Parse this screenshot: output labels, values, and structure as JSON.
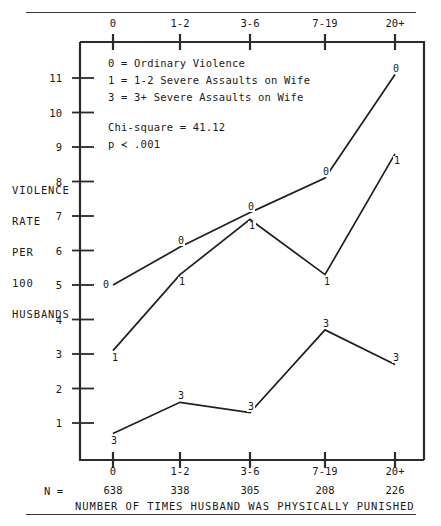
{
  "figure": {
    "y_axis_title_lines": [
      "VIOLENCE",
      "RATE",
      "PER",
      "100",
      "HUSBANDS"
    ],
    "x_axis_title": "NUMBER OF TIMES HUSBAND WAS PHYSICALLY PUNISHED",
    "n_prefix": "N =",
    "legend_lines": [
      "0 = Ordinary Violence",
      "1 = 1-2 Severe Assaults on Wife",
      "3 = 3+ Severe Assaults on Wife"
    ],
    "stats_lines": [
      "Chi-square = 41.12",
      "p ≺ .001"
    ]
  },
  "chart_data": {
    "type": "line",
    "title": "",
    "xlabel": "NUMBER OF TIMES HUSBAND WAS PHYSICALLY PUNISHED",
    "ylabel": "VIOLENCE RATE PER 100 HUSBANDS",
    "categories": [
      "0",
      "1-2",
      "3-6",
      "7-19",
      "20+"
    ],
    "group_sizes": [
      638,
      338,
      305,
      208,
      226
    ],
    "yticks": [
      1,
      2,
      3,
      4,
      5,
      6,
      7,
      8,
      9,
      10,
      11
    ],
    "ylim": [
      0,
      11.6
    ],
    "grid": false,
    "legend_position": "inside-top-left",
    "annotations": [
      "Chi-square = 41.12",
      "p < .001"
    ],
    "series": [
      {
        "name": "0",
        "label": "Ordinary Violence",
        "marker_label": "0",
        "values": [
          5.0,
          6.1,
          7.1,
          8.1,
          11.1
        ]
      },
      {
        "name": "1",
        "label": "1-2 Severe Assaults on Wife",
        "marker_label": "1",
        "values": [
          3.1,
          5.3,
          6.9,
          5.3,
          8.8
        ]
      },
      {
        "name": "3",
        "label": "3+ Severe Assaults on Wife",
        "marker_label": "3",
        "values": [
          0.7,
          1.6,
          1.3,
          3.7,
          2.7
        ]
      }
    ]
  }
}
